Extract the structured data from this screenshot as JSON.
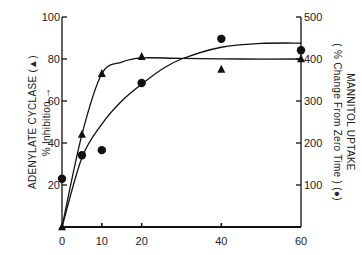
{
  "chart_data": {
    "type": "line",
    "title": "",
    "xlabel": "",
    "ylabel_left": "ADENYLATE CYCLASE (▲) % Inhibition →",
    "ylabel_left_line1": "ADENYLATE CYCLASE (▲)",
    "ylabel_left_line2": "% Inhibition →",
    "ylabel_right": "MANNITOL UPTAKE (% Change From Zero Time) (●)",
    "ylabel_right_line1": "MANNITOL UPTAKE",
    "ylabel_right_line2": "( % Change From Zero Time ) (●)",
    "xlim": [
      0,
      60
    ],
    "ylim_left": [
      0,
      100
    ],
    "ylim_right": [
      0,
      500
    ],
    "x_ticks": [
      0,
      10,
      20,
      40,
      60
    ],
    "x_tick_labels": [
      "0",
      "10",
      "20",
      "40",
      "60"
    ],
    "y_left_ticks": [
      20,
      40,
      60,
      80,
      100
    ],
    "y_left_tick_labels": [
      "20",
      "40",
      "60",
      "80",
      "100"
    ],
    "y_right_ticks": [
      100,
      200,
      300,
      400,
      500
    ],
    "y_right_tick_labels": [
      "100",
      "200",
      "300",
      "400",
      "500"
    ],
    "grid": false,
    "legend": "none (markers identified in axis labels)",
    "series": [
      {
        "name": "Adenylate cyclase % inhibition",
        "marker": "triangle",
        "axis": "left",
        "x": [
          0,
          5,
          10,
          20,
          40,
          60
        ],
        "y": [
          0,
          44,
          73,
          81,
          75,
          80
        ],
        "fit_curve": [
          [
            0,
            0
          ],
          [
            5,
            44
          ],
          [
            10,
            73
          ],
          [
            15,
            78.5
          ],
          [
            20,
            80.5
          ],
          [
            30,
            80.3
          ],
          [
            45,
            80
          ],
          [
            60,
            80
          ]
        ]
      },
      {
        "name": "Mannitol uptake % change from zero time",
        "marker": "circle",
        "axis": "right",
        "x": [
          0,
          5,
          10,
          20,
          40,
          60
        ],
        "y": [
          115,
          171,
          183,
          343,
          448,
          421
        ],
        "fit_curve": [
          [
            0,
            0
          ],
          [
            5,
            165
          ],
          [
            10,
            245
          ],
          [
            15,
            300
          ],
          [
            20,
            340
          ],
          [
            25,
            375
          ],
          [
            30,
            400
          ],
          [
            40,
            428
          ],
          [
            50,
            437
          ],
          [
            60,
            438
          ]
        ]
      }
    ]
  }
}
